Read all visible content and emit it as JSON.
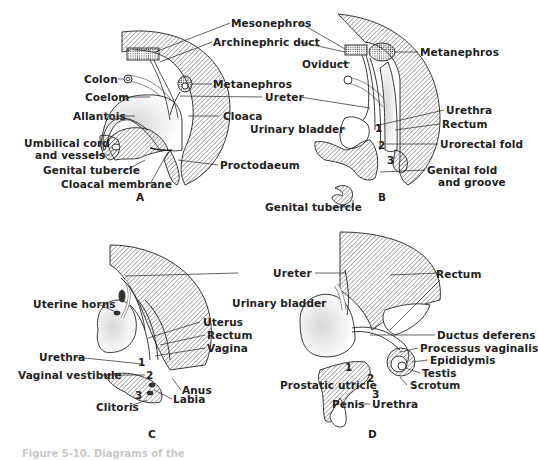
{
  "figure": {
    "caption": "Figure 5-10. Diagrams of the"
  },
  "panels": {
    "A": {
      "letter": "A",
      "labels": {
        "mesonephros": "Mesonephros",
        "archinephric_duct": "Archinephric duct",
        "colon": "Colon",
        "metanephros": "Metanephros",
        "coelom": "Coelom",
        "ureter": "Ureter",
        "allantois": "Allantois",
        "cloaca": "Cloaca",
        "umbilical_cord_1": "Umbilical cord",
        "umbilical_cord_2": "and vessels",
        "genital_tubercle": "Genital tubercle",
        "cloacal_membrane": "Cloacal membrane",
        "proctodaeum": "Proctodaeum"
      }
    },
    "B": {
      "letter": "B",
      "labels": {
        "metanephros": "Metanephros",
        "oviduct": "Oviduct",
        "urethra": "Urethra",
        "urinary_bladder": "Urinary bladder",
        "rectum": "Rectum",
        "urorectal_fold": "Urorectal fold",
        "genital_fold_1": "Genital fold",
        "genital_fold_2": "and groove",
        "genital_tubercle": "Genital tubercle"
      },
      "numbers": [
        "1",
        "2",
        "3"
      ]
    },
    "C": {
      "letter": "C",
      "labels": {
        "uterine_horns": "Uterine horns",
        "uterus": "Uterus",
        "rectum": "Rectum",
        "vagina": "Vagina",
        "urethra": "Urethra",
        "vaginal_vestibule": "Vaginal vestibule",
        "anus": "Anus",
        "labia": "Labia",
        "clitoris": "Clitoris"
      },
      "numbers": [
        "1",
        "2",
        "3"
      ]
    },
    "D": {
      "letter": "D",
      "labels": {
        "ureter": "Ureter",
        "rectum": "Rectum",
        "urinary_bladder": "Urinary bladder",
        "ductus_deferens": "Ductus deferens",
        "processus_vaginalis": "Processus vaginalis",
        "epididymis": "Epididymis",
        "testis": "Testis",
        "scrotum": "Scrotum",
        "prostatic_utricle": "Prostatic utricle",
        "penis": "Penis",
        "urethra": "Urethra"
      },
      "numbers": [
        "1",
        "2",
        "3"
      ]
    }
  },
  "colors": {
    "ink": "#222222",
    "hatch": "#555555",
    "shade": "#bdbdbd",
    "background": "#ffffff"
  }
}
